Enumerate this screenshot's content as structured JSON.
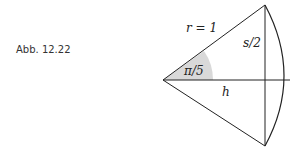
{
  "caption": "Abb. 12.22",
  "labels": {
    "radius": "r = 1",
    "half_chord": "s/2",
    "angle": "π/5",
    "height": "h"
  },
  "colors": {
    "line": "#222222",
    "angle_fill": "#d9d9d9"
  }
}
